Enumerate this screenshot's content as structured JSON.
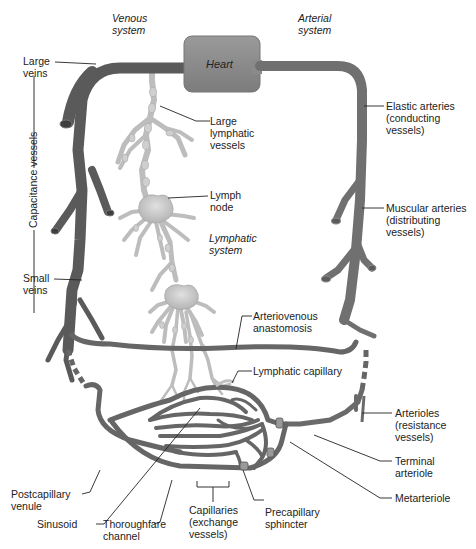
{
  "system_labels": {
    "venous": "Venous\nsystem",
    "arterial": "Arterial\nsystem",
    "lymphatic": "Lymphatic\nsystem"
  },
  "heart": {
    "label": "Heart"
  },
  "bracket_label": "Capacitance vessels",
  "labels": {
    "large_veins": "Large\nveins",
    "small_veins": "Small\nveins",
    "large_lymphatic": "Large\nlymphatic\nvessels",
    "lymph_node": "Lymph\nnode",
    "elastic_arteries": "Elastic arteries\n(conducting\nvessels)",
    "muscular_arteries": "Muscular arteries\n(distributing\nvessels)",
    "av_anastomosis": "Arteriovenous\nanastomosis",
    "lymphatic_capillary": "Lymphatic capillary",
    "arterioles": "Arterioles\n(resistance\nvessels)",
    "terminal_arteriole": "Terminal\narteriole",
    "metarteriole": "Metarteriole",
    "postcapillary_venule": "Postcapillary\nvenule",
    "sinusoid": "Sinusoid",
    "thoroughfare_channel": "Thoroughfare\nchannel",
    "capillaries": "Capillaries\n(exchange\nvessels)",
    "precapillary_sphincter": "Precapillary\nsphincter"
  },
  "colors": {
    "vessel": "#6e6e6e",
    "vessel_dark": "#4a4a4a",
    "heart": "#8c8c8c",
    "lymph": "#c8c8c8",
    "lymph_stroke": "#a8a8a8",
    "leader": "#222222"
  }
}
